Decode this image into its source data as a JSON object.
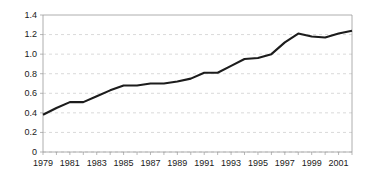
{
  "chart_data": {
    "type": "line",
    "title": "",
    "subtitle": "",
    "xlabel": "",
    "ylabel": "",
    "x": [
      1979,
      1980,
      1981,
      1982,
      1983,
      1984,
      1985,
      1986,
      1987,
      1988,
      1989,
      1990,
      1991,
      1992,
      1993,
      1994,
      1995,
      1996,
      1997,
      1998,
      1999,
      2000,
      2001,
      2002
    ],
    "values": [
      0.38,
      0.45,
      0.51,
      0.51,
      0.57,
      0.63,
      0.68,
      0.68,
      0.7,
      0.7,
      0.72,
      0.75,
      0.81,
      0.81,
      0.88,
      0.95,
      0.96,
      1.0,
      1.12,
      1.21,
      1.18,
      1.17,
      1.21,
      1.24
    ],
    "series": [
      {
        "name": "",
        "color": "#1c1c1c",
        "values": [
          0.38,
          0.45,
          0.51,
          0.51,
          0.57,
          0.63,
          0.68,
          0.68,
          0.7,
          0.7,
          0.72,
          0.75,
          0.81,
          0.81,
          0.88,
          0.95,
          0.96,
          1.0,
          1.12,
          1.21,
          1.18,
          1.17,
          1.21,
          1.24
        ]
      }
    ],
    "xlim": [
      1979,
      2002
    ],
    "ylim": [
      0,
      1.4
    ],
    "y_ticks": [
      0,
      0.2,
      0.4,
      0.6,
      0.8,
      1.0,
      1.2,
      1.4
    ],
    "y_tick_labels": [
      "0",
      "0.2",
      "0.4",
      "0.6",
      "0.8",
      "1.0",
      "1.2",
      "1.4"
    ],
    "x_ticks": [
      1979,
      1980,
      1981,
      1982,
      1983,
      1984,
      1985,
      1986,
      1987,
      1988,
      1989,
      1990,
      1991,
      1992,
      1993,
      1994,
      1995,
      1996,
      1997,
      1998,
      1999,
      2000,
      2001,
      2002
    ],
    "x_tick_labels_shown": [
      "1979",
      "1981",
      "1983",
      "1985",
      "1987",
      "1989",
      "1991",
      "1993",
      "1995",
      "1997",
      "1999",
      "2001"
    ],
    "x_labeled_values": [
      1979,
      1981,
      1983,
      1985,
      1987,
      1989,
      1991,
      1993,
      1995,
      1997,
      1999,
      2001
    ],
    "grid": {
      "horizontal": true,
      "vertical": false,
      "style": "dashed",
      "color": "#c8c8c8"
    },
    "legend": {
      "visible": false,
      "position": "none",
      "entries": []
    },
    "annotations": [],
    "background_color": "#ffffff",
    "axis_color": "#9a9a9a",
    "text_color": "#1a1a1a"
  },
  "layout": {
    "plot_left": 43,
    "plot_right": 352,
    "plot_top": 15,
    "plot_bottom": 152,
    "canvas_width": 378,
    "canvas_height": 187
  }
}
